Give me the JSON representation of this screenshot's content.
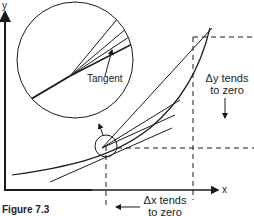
{
  "figure": {
    "caption": "Figure 7.3",
    "axes": {
      "x_label": "x",
      "y_label": "y"
    },
    "inset": {
      "label": "Tangent"
    },
    "annotations": {
      "dy_line1": "Δy tends",
      "dy_line2": "to zero",
      "dx_line1": "Δx tends",
      "dx_line2": "to zero"
    },
    "colors": {
      "ink": "#1a1a1a",
      "background": "#ffffff"
    }
  }
}
